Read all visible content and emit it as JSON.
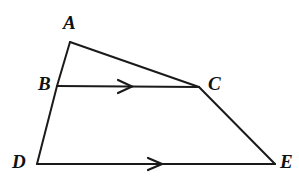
{
  "figure": {
    "background_color": "#ffffff",
    "stroke_color": "#1a1a1a",
    "label_color": "#111111",
    "stroke_width": 2,
    "canvas": {
      "width": 299,
      "height": 187
    }
  },
  "points": {
    "A": {
      "label": "A",
      "x": 70,
      "y": 42,
      "label_x": 63,
      "label_y": 13
    },
    "B": {
      "label": "B",
      "x": 57,
      "y": 86,
      "label_x": 38,
      "label_y": 74
    },
    "C": {
      "label": "C",
      "x": 199,
      "y": 87,
      "label_x": 208,
      "label_y": 74
    },
    "D": {
      "label": "D",
      "x": 37,
      "y": 164,
      "label_x": 12,
      "label_y": 152
    },
    "E": {
      "label": "E",
      "x": 275,
      "y": 164,
      "label_x": 280,
      "label_y": 152
    }
  },
  "segments": [
    {
      "name": "segment-AC",
      "from": "A",
      "to": "C",
      "path": "M 70 42 L 199 87"
    },
    {
      "name": "segment-AB",
      "from": "A",
      "to": "B",
      "path": "M 70 42 L 57 86"
    },
    {
      "name": "segment-BD",
      "from": "B",
      "to": "D",
      "path": "M 57 86 L 37 164"
    },
    {
      "name": "segment-BC",
      "from": "B",
      "to": "C",
      "path": "M 57 86 L 199 87"
    },
    {
      "name": "segment-CE",
      "from": "C",
      "to": "E",
      "path": "M 199 87 L 275 164"
    },
    {
      "name": "segment-DE",
      "from": "D",
      "to": "E",
      "path": "M 37 164 L 275 164"
    }
  ],
  "arrow_marks": [
    {
      "name": "parallel-arrow-bc",
      "on_segment": "BC",
      "direction": "right",
      "x": 125,
      "y": 86,
      "path": "M 118 80 L 132 86.5 L 118 93"
    },
    {
      "name": "parallel-arrow-de",
      "on_segment": "DE",
      "direction": "right",
      "x": 155,
      "y": 164,
      "path": "M 148 158 L 162 164 L 148 170"
    }
  ]
}
